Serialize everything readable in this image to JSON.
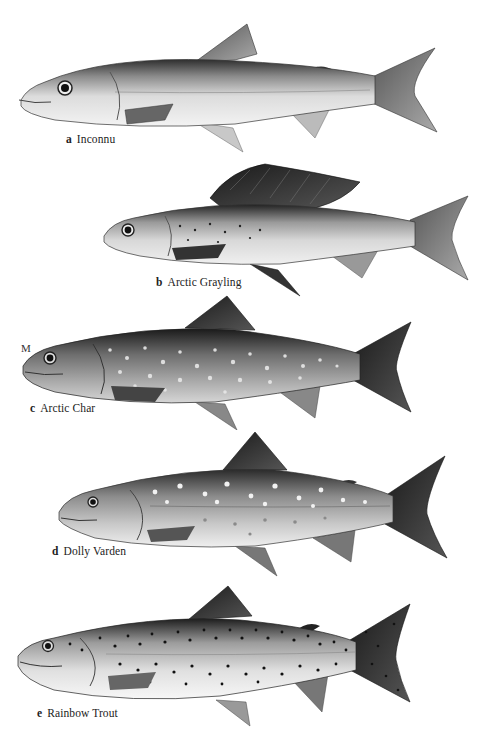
{
  "plate": {
    "type": "fish species illustration plate",
    "background": "#ffffff"
  },
  "marker": {
    "text": "M"
  },
  "fish": [
    {
      "letter": "a",
      "name": "Inconnu",
      "pattern": "plain silver with faint pale dots along back"
    },
    {
      "letter": "b",
      "name": "Arctic Grayling",
      "pattern": "large sail-like dark dorsal fin, small dark spots on front body"
    },
    {
      "letter": "c",
      "name": "Arctic Char",
      "pattern": "dark body with many pale spots"
    },
    {
      "letter": "d",
      "name": "Dolly Varden",
      "pattern": "pale spots on grey body"
    },
    {
      "letter": "e",
      "name": "Rainbow Trout",
      "pattern": "dense small black spots on body and tail"
    }
  ]
}
